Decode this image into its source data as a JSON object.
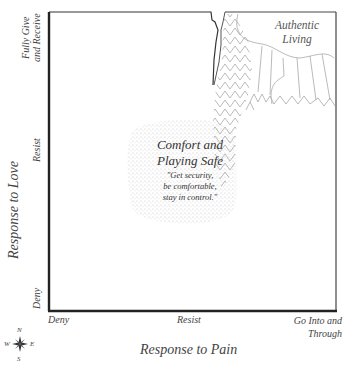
{
  "diagram": {
    "x_axis": {
      "title": "Response to Pain",
      "ticks": [
        "Deny",
        "Resist",
        "Go Into and Through"
      ],
      "ticks_lines": [
        [
          "Deny"
        ],
        [
          "Resist"
        ],
        [
          "Go Into and",
          "Through"
        ]
      ]
    },
    "y_axis": {
      "title": "Response to Love",
      "ticks": [
        "Deny",
        "Resist",
        "Fully Give and Receive"
      ],
      "ticks_lines": [
        [
          "Deny"
        ],
        [
          "Resist"
        ],
        [
          "Fully Give",
          "and Receive"
        ]
      ]
    },
    "regions": [
      {
        "name": "Comfort and Playing Safe",
        "title_lines": [
          "Comfort and",
          "Playing Safe"
        ],
        "quote_lines": [
          "\"Get security,",
          "be comfortable,",
          "stay in control.\""
        ],
        "fill": "stippled dots"
      },
      {
        "name": "Authentic Living",
        "title_lines": [
          "Authentic",
          "Living"
        ],
        "fill": "mountain / forest line pattern"
      }
    ],
    "compass": {
      "n": "N",
      "s": "S",
      "e": "E",
      "w": "W"
    },
    "colors": {
      "axis": "#222222",
      "pattern": "#a8a8a8",
      "stipple": "#9a9a9a",
      "text": "#444444"
    }
  }
}
